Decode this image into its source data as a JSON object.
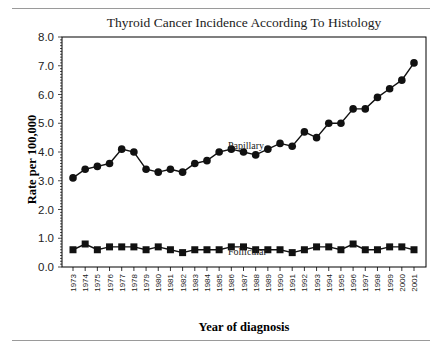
{
  "chart_data": {
    "type": "line",
    "title": "Thyroid Cancer Incidence According To Histology",
    "xlabel": "Year of diagnosis",
    "ylabel": "Rate per 100,000",
    "ylim": [
      0.0,
      8.0
    ],
    "yticks": [
      "0.0",
      "1.0",
      "2.0",
      "3.0",
      "4.0",
      "5.0",
      "6.0",
      "7.0",
      "8.0"
    ],
    "grid": false,
    "legend_position": "inline labels",
    "categories": [
      "1973",
      "1974",
      "1975",
      "1976",
      "1977",
      "1978",
      "1979",
      "1980",
      "1981",
      "1982",
      "1983",
      "1984",
      "1985",
      "1986",
      "1987",
      "1988",
      "1989",
      "1990",
      "1991",
      "1992",
      "1993",
      "1994",
      "1995",
      "1996",
      "1997",
      "1998",
      "1999",
      "2000",
      "2001"
    ],
    "series": [
      {
        "name": "Papillary",
        "marker": "circle",
        "values": [
          3.1,
          3.4,
          3.5,
          3.6,
          4.1,
          4.0,
          3.4,
          3.3,
          3.4,
          3.3,
          3.6,
          3.7,
          4.0,
          4.1,
          4.0,
          3.9,
          4.1,
          4.3,
          4.2,
          4.7,
          4.5,
          5.0,
          5.0,
          5.5,
          5.5,
          5.9,
          6.2,
          6.5,
          7.1
        ]
      },
      {
        "name": "Follicular",
        "marker": "square",
        "values": [
          0.6,
          0.8,
          0.6,
          0.7,
          0.7,
          0.7,
          0.6,
          0.7,
          0.6,
          0.5,
          0.6,
          0.6,
          0.6,
          0.7,
          0.7,
          0.6,
          0.6,
          0.6,
          0.5,
          0.6,
          0.7,
          0.7,
          0.6,
          0.8,
          0.6,
          0.6,
          0.7,
          0.7,
          0.6
        ]
      }
    ],
    "annotations": [
      {
        "text": "Papillary",
        "near_series": "Papillary"
      },
      {
        "text": "Follicular",
        "near_series": "Follicular"
      }
    ]
  }
}
